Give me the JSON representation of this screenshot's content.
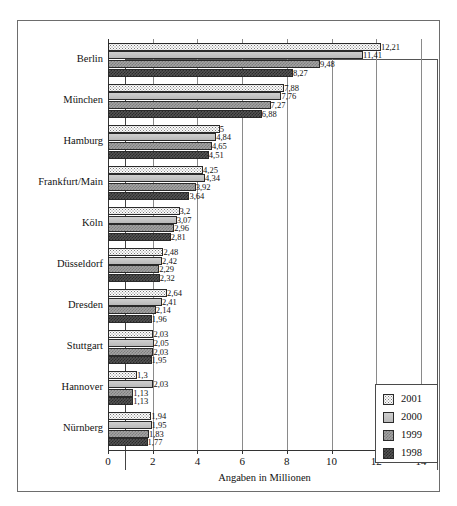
{
  "chart": {
    "type": "bar",
    "orientation": "horizontal",
    "xlabel": "Angaben in Millionen",
    "ylabel": "",
    "title": "",
    "xlim": [
      0,
      14
    ],
    "xticks": [
      0,
      2,
      4,
      6,
      8,
      10,
      12,
      14
    ],
    "grid": true,
    "legend_position": "bottom-right",
    "categories": [
      "Berlin",
      "München",
      "Hamburg",
      "Frankfurt/Main",
      "Köln",
      "Düsseldorf",
      "Dresden",
      "Stuttgart",
      "Hannover",
      "Nürnberg"
    ],
    "series": [
      {
        "name": "2001",
        "color": "#fbfbfb",
        "pattern": "fine-dots",
        "values": [
          12.21,
          7.88,
          5,
          4.25,
          3.2,
          2.48,
          2.64,
          2.03,
          1.3,
          1.94
        ],
        "labels": [
          "12,21",
          "7,88",
          "5",
          "4,25",
          "3,2",
          "2,48",
          "2,64",
          "2,03",
          "1,3",
          "1,94"
        ]
      },
      {
        "name": "2000",
        "color": "#c2c2c2",
        "pattern": "solid-light-gray",
        "values": [
          11.41,
          7.76,
          4.84,
          4.34,
          3.07,
          2.42,
          2.41,
          2.05,
          2.03,
          1.95
        ],
        "labels": [
          "11,41",
          "7,76",
          "4,84",
          "4,34",
          "3,07",
          "2,42",
          "2,41",
          "2,05",
          "2,03",
          "1,95"
        ]
      },
      {
        "name": "1999",
        "color": "#a3a3a3",
        "pattern": "medium-checker",
        "values": [
          9.48,
          7.27,
          4.65,
          3.92,
          2.96,
          2.29,
          2.14,
          2.03,
          1.13,
          1.83
        ],
        "labels": [
          "9,48",
          "7,27",
          "4,65",
          "3,92",
          "2,96",
          "2,29",
          "2,14",
          "2,03",
          "1,13",
          "1,83"
        ]
      },
      {
        "name": "1998",
        "color": "#545454",
        "pattern": "dark-checker",
        "values": [
          8.27,
          6.88,
          4.51,
          3.64,
          2.81,
          2.32,
          1.96,
          1.95,
          1.13,
          1.77
        ],
        "labels": [
          "8,27",
          "6,88",
          "4,51",
          "3,64",
          "2,81",
          "2,32",
          "1,96",
          "1,95",
          "1,13",
          "1,77"
        ]
      }
    ]
  }
}
